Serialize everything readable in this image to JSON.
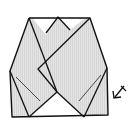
{
  "diagram": {
    "type": "origami-step",
    "colors": {
      "background": "#ffffff",
      "paper_shaded": "#dcdcdc",
      "paper_white": "#ffffff",
      "line": "#111111",
      "crease": "#333333"
    },
    "elements": [
      {
        "name": "folded-model",
        "description": "folded paper shape with overlapping diagonal flaps"
      },
      {
        "name": "crease-line-left",
        "description": "thin diagonal crease on left flap"
      },
      {
        "name": "crease-line-right",
        "description": "thin diagonal crease on right flap"
      },
      {
        "name": "turn-over-arrow",
        "description": "arrow pointing down-left at lower right"
      }
    ]
  }
}
